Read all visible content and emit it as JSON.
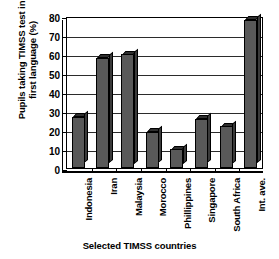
{
  "chart_data": {
    "type": "bar",
    "title": "",
    "xlabel": "Selected TIMSS countries",
    "ylabel": "Pupils taking TIMSS test in\nfirst language (%)",
    "categories": [
      "Indonesia",
      "Iran",
      "Malaysia",
      "Morocco",
      "Phillippines",
      "Singapore",
      "South Africa",
      "Int. ave."
    ],
    "values": [
      27,
      58,
      60,
      19,
      10,
      26,
      22,
      78
    ],
    "ylim": [
      0,
      80
    ],
    "ytick_labels": [
      "0",
      "10",
      "20",
      "30",
      "40",
      "50",
      "60",
      "70",
      "80"
    ],
    "ytick_values": [
      0,
      10,
      20,
      30,
      40,
      50,
      60,
      70,
      80
    ],
    "grid": true,
    "legend": false,
    "bar_color": "#595959",
    "bar_edge_color": "#000000",
    "background_color": "#ffffff"
  }
}
